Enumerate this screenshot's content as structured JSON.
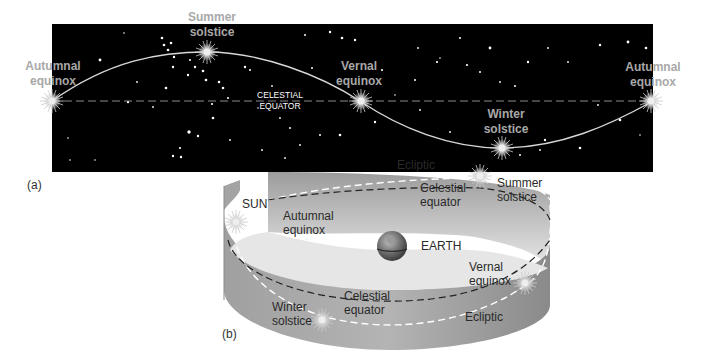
{
  "panel_a": {
    "label": "(a)",
    "colors": {
      "sky": "#000000",
      "ecliptic": "#d8d8d8",
      "equator": "#8a8a8a",
      "label_gray": "#a8a8a8"
    },
    "labels": {
      "autumnal_left_1": "Autumnal",
      "autumnal_left_2": "equinox",
      "summer_1": "Summer",
      "summer_2": "solstice",
      "vernal_1": "Vernal",
      "vernal_2": "equinox",
      "celestial_1": "CELESTIAL",
      "celestial_2": "EQUATOR",
      "winter_1": "Winter",
      "winter_2": "solstice",
      "autumnal_right_1": "Autumnal",
      "autumnal_right_2": "equinox"
    }
  },
  "panel_b": {
    "label": "(b)",
    "colors": {
      "band": "#9a9a9a",
      "band_light": "#d4d4d4",
      "ecliptic": "#ffffff",
      "equator": "#222222"
    },
    "labels": {
      "sun": "SUN",
      "ecliptic_top": "Ecliptic",
      "celestial_top_1": "Celestial",
      "celestial_top_2": "equator",
      "summer_1": "Summer",
      "summer_2": "solstice",
      "autumnal_1": "Autumnal",
      "autumnal_2": "equinox",
      "earth": "EARTH",
      "vernal_1": "Vernal",
      "vernal_2": "equinox",
      "winter_1": "Winter",
      "winter_2": "solstice",
      "celestial_bottom_1": "Celestial",
      "celestial_bottom_2": "equator",
      "ecliptic_bottom": "Ecliptic"
    }
  }
}
